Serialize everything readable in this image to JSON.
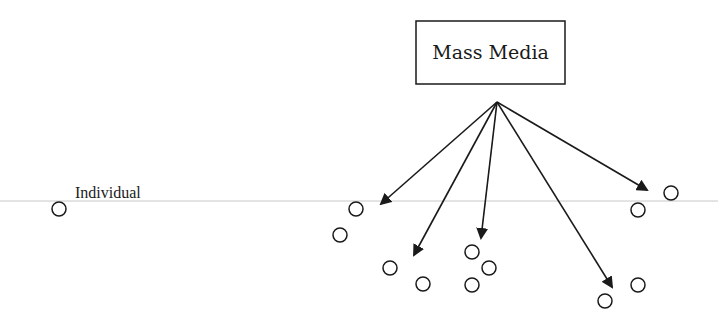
{
  "diagram": {
    "title": "Mass Media",
    "source_box": {
      "label": "Mass Media",
      "x": 416,
      "y": 21,
      "w": 149,
      "h": 63
    },
    "origin": {
      "x": 497,
      "y": 102
    },
    "baseline": {
      "y": 201,
      "color": "#c8c8c8"
    },
    "individual": {
      "label": "Individual",
      "x": 59,
      "y": 209,
      "label_x": 75,
      "label_y": 198
    },
    "arrows": [
      {
        "to_x": 381,
        "to_y": 204
      },
      {
        "to_x": 414,
        "to_y": 255
      },
      {
        "to_x": 481,
        "to_y": 238
      },
      {
        "to_x": 612,
        "to_y": 287
      },
      {
        "to_x": 647,
        "to_y": 190
      }
    ],
    "circles": [
      {
        "x": 356,
        "y": 209
      },
      {
        "x": 340,
        "y": 235
      },
      {
        "x": 390,
        "y": 268
      },
      {
        "x": 423,
        "y": 284
      },
      {
        "x": 472,
        "y": 252
      },
      {
        "x": 489,
        "y": 268
      },
      {
        "x": 472,
        "y": 285
      },
      {
        "x": 671,
        "y": 193
      },
      {
        "x": 638,
        "y": 210
      },
      {
        "x": 638,
        "y": 285
      },
      {
        "x": 605,
        "y": 301
      }
    ],
    "colors": {
      "stroke": "#1a1a1a",
      "line": "#c8c8c8",
      "background": "#ffffff"
    }
  }
}
